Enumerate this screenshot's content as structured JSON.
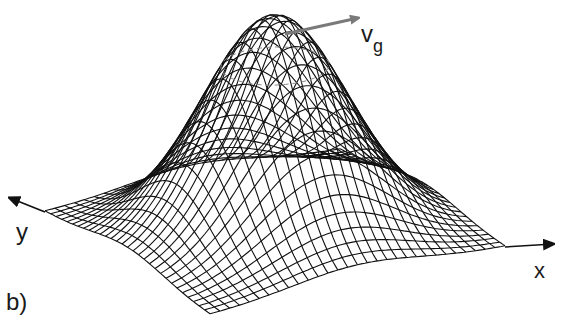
{
  "figure": {
    "panel_label": "b)",
    "labels": {
      "velocity_main": "v",
      "velocity_sub": "g",
      "x_axis": "x",
      "y_axis": "y"
    },
    "colors": {
      "mesh": "#111111",
      "velocity_arrow": "#7a7a7a",
      "dashed_contour": "#8a8a8a",
      "axis": "#111111",
      "background": "#ffffff"
    },
    "surface": {
      "grid_n": 30,
      "gaussian_sigma": 0.22,
      "peak_height_px": 215,
      "base_corners": {
        "left": [
          45,
          212
        ],
        "back": [
          340,
          150
        ],
        "right": [
          505,
          247
        ],
        "front": [
          210,
          315
        ]
      }
    },
    "velocity_arrow": {
      "from": [
        285,
        34
      ],
      "to": [
        358,
        18
      ]
    },
    "x_axis_arrow": {
      "from": [
        505,
        247
      ],
      "to": [
        553,
        244
      ]
    },
    "y_axis_arrow": {
      "from": [
        45,
        212
      ],
      "to": [
        10,
        198
      ]
    }
  }
}
